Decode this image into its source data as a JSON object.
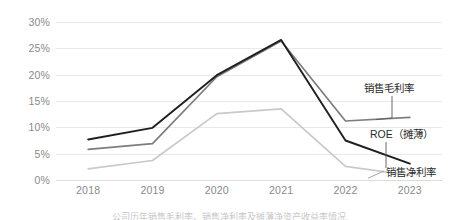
{
  "chart_data": {
    "type": "line",
    "title": "",
    "xlabel": "",
    "ylabel": "",
    "categories": [
      "2018",
      "2019",
      "2020",
      "2021",
      "2022",
      "2023"
    ],
    "ylim": [
      0,
      30
    ],
    "ytick_values": [
      30,
      25,
      20,
      15,
      10,
      5,
      0
    ],
    "ytick_labels": [
      "30%",
      "25%",
      "20%",
      "15%",
      "10%",
      "5%",
      "0%"
    ],
    "grid": true,
    "legend_position": "right-annotations",
    "series": [
      {
        "name": "销售毛利率",
        "color": "#7d7d7d",
        "values": [
          5.8,
          6.9,
          19.6,
          26.4,
          11.2,
          11.9
        ]
      },
      {
        "name": "ROE（摊薄）",
        "color": "#1f1f1f",
        "values": [
          7.7,
          9.9,
          19.9,
          26.6,
          7.5,
          3.1
        ]
      },
      {
        "name": "销售净利率",
        "color": "#c9c9c9",
        "values": [
          2.1,
          3.7,
          12.6,
          13.5,
          2.6,
          0.9
        ]
      }
    ],
    "annotations": [
      {
        "label": "销售毛利率",
        "series": "销售毛利率"
      },
      {
        "label": "ROE（摊薄）",
        "series": "ROE（摊薄）"
      },
      {
        "label": "销售净利率",
        "series": "销售净利率"
      }
    ]
  },
  "caption": "公司历年销售毛利率、销售净利率及摊薄净资产收益率情况",
  "axis": {
    "y_labels": [
      "30%",
      "25%",
      "20%",
      "15%",
      "10%",
      "5%",
      "0%"
    ],
    "x_labels": [
      "2018",
      "2019",
      "2020",
      "2021",
      "2022",
      "2023"
    ]
  },
  "labels": {
    "gross_margin": "销售毛利率",
    "roe": "ROE（摊薄）",
    "net_margin": "销售净利率"
  }
}
